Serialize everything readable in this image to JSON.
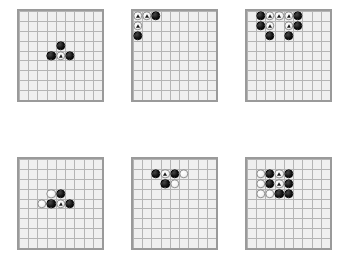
{
  "figure": {
    "kind": "go-board-diagram-grid",
    "board_size": 9,
    "layout": {
      "columns": 3,
      "rows": 2
    },
    "colors": {
      "page_background": "#ffffff",
      "board_background": "#efefef",
      "board_border": "#9a9a9a",
      "grid_line": "#b4b4b4",
      "black_stone": "#111111",
      "white_stone": "#f7f7f7",
      "white_stone_edge": "#8f8f8f",
      "marker_triangle": "#1a1a1a"
    },
    "marker_shape": "triangle"
  },
  "boards": [
    {
      "id": "board-1",
      "name": "board-top-left",
      "size": 9,
      "x": 17,
      "y": 9,
      "w": 87,
      "h": 93,
      "stones": [
        {
          "color": "black",
          "col": 4,
          "row": 3
        },
        {
          "color": "black",
          "col": 3,
          "row": 4
        },
        {
          "color": "black",
          "col": 5,
          "row": 4
        },
        {
          "color": "white",
          "col": 4,
          "row": 4,
          "marked": true
        }
      ]
    },
    {
      "id": "board-2",
      "name": "board-top-center",
      "size": 9,
      "x": 131,
      "y": 9,
      "w": 87,
      "h": 93,
      "stones": [
        {
          "color": "black",
          "col": 2,
          "row": 0
        },
        {
          "color": "black",
          "col": 0,
          "row": 2
        },
        {
          "color": "white",
          "col": 0,
          "row": 0,
          "marked": true
        },
        {
          "color": "white",
          "col": 1,
          "row": 0,
          "marked": true
        },
        {
          "color": "white",
          "col": 0,
          "row": 1,
          "marked": true
        }
      ]
    },
    {
      "id": "board-3",
      "name": "board-top-right",
      "size": 9,
      "x": 245,
      "y": 9,
      "w": 87,
      "h": 93,
      "stones": [
        {
          "color": "black",
          "col": 1,
          "row": 0
        },
        {
          "color": "black",
          "col": 5,
          "row": 0
        },
        {
          "color": "black",
          "col": 1,
          "row": 1
        },
        {
          "color": "black",
          "col": 5,
          "row": 1
        },
        {
          "color": "black",
          "col": 2,
          "row": 2
        },
        {
          "color": "black",
          "col": 4,
          "row": 2
        },
        {
          "color": "white",
          "col": 2,
          "row": 0,
          "marked": true
        },
        {
          "color": "white",
          "col": 3,
          "row": 0,
          "marked": true
        },
        {
          "color": "white",
          "col": 4,
          "row": 0,
          "marked": true
        },
        {
          "color": "white",
          "col": 2,
          "row": 1,
          "marked": true
        },
        {
          "color": "white",
          "col": 4,
          "row": 1,
          "marked": true
        }
      ]
    },
    {
      "id": "board-4",
      "name": "board-bottom-left",
      "size": 9,
      "x": 17,
      "y": 157,
      "w": 87,
      "h": 93,
      "stones": [
        {
          "color": "white",
          "col": 3,
          "row": 3
        },
        {
          "color": "white",
          "col": 2,
          "row": 4
        },
        {
          "color": "black",
          "col": 4,
          "row": 3
        },
        {
          "color": "black",
          "col": 3,
          "row": 4
        },
        {
          "color": "black",
          "col": 5,
          "row": 4
        },
        {
          "color": "white",
          "col": 4,
          "row": 4,
          "marked": true
        }
      ]
    },
    {
      "id": "board-5",
      "name": "board-bottom-center",
      "size": 9,
      "x": 131,
      "y": 157,
      "w": 87,
      "h": 93,
      "stones": [
        {
          "color": "black",
          "col": 2,
          "row": 1
        },
        {
          "color": "black",
          "col": 4,
          "row": 1
        },
        {
          "color": "white",
          "col": 5,
          "row": 1
        },
        {
          "color": "black",
          "col": 3,
          "row": 2
        },
        {
          "color": "white",
          "col": 4,
          "row": 2
        },
        {
          "color": "white",
          "col": 3,
          "row": 1,
          "marked": true
        }
      ]
    },
    {
      "id": "board-6",
      "name": "board-bottom-right",
      "size": 9,
      "x": 245,
      "y": 157,
      "w": 87,
      "h": 93,
      "stones": [
        {
          "color": "white",
          "col": 1,
          "row": 1
        },
        {
          "color": "white",
          "col": 1,
          "row": 2
        },
        {
          "color": "white",
          "col": 1,
          "row": 3
        },
        {
          "color": "white",
          "col": 2,
          "row": 3
        },
        {
          "color": "black",
          "col": 2,
          "row": 1
        },
        {
          "color": "black",
          "col": 4,
          "row": 1
        },
        {
          "color": "black",
          "col": 2,
          "row": 2
        },
        {
          "color": "black",
          "col": 4,
          "row": 2
        },
        {
          "color": "black",
          "col": 3,
          "row": 3
        },
        {
          "color": "black",
          "col": 4,
          "row": 3
        },
        {
          "color": "white",
          "col": 3,
          "row": 1,
          "marked": true
        },
        {
          "color": "white",
          "col": 3,
          "row": 2,
          "marked": true
        }
      ]
    }
  ]
}
